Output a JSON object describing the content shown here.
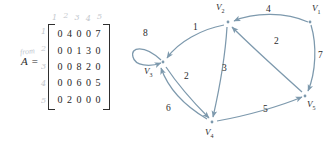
{
  "matrix": {
    "name": "A",
    "equals_sign": "=",
    "column_indices": [
      "1",
      "2",
      "3",
      "4",
      "5"
    ],
    "row_indices": [
      "1",
      "2",
      "3",
      "4",
      "5"
    ],
    "annotation": "from",
    "rows": [
      [
        "0",
        "4",
        "0",
        "0",
        "7"
      ],
      [
        "0",
        "0",
        "1",
        "3",
        "0"
      ],
      [
        "0",
        "0",
        "8",
        "2",
        "0"
      ],
      [
        "0",
        "0",
        "6",
        "0",
        "5"
      ],
      [
        "0",
        "2",
        "0",
        "0",
        "0"
      ]
    ]
  },
  "graph": {
    "ink_color": "#7d99ad",
    "text_color": "#2b2b2b",
    "vertices": [
      {
        "id": "v1",
        "label": "V",
        "sub": "1",
        "x": 184,
        "y": 22,
        "label_x": 186,
        "label_y": 4
      },
      {
        "id": "v2",
        "label": "V",
        "sub": "2",
        "x": 102,
        "y": 22,
        "label_x": 90,
        "label_y": 3
      },
      {
        "id": "v3",
        "label": "V",
        "sub": "3",
        "x": 37,
        "y": 62,
        "label_x": 20,
        "label_y": 66
      },
      {
        "id": "v4",
        "label": "V",
        "sub": "4",
        "x": 86,
        "y": 122,
        "label_x": 80,
        "label_y": 128
      },
      {
        "id": "v5",
        "label": "V",
        "sub": "5",
        "x": 179,
        "y": 96,
        "label_x": 180,
        "label_y": 100
      }
    ],
    "edges": [
      {
        "id": "e-v1-v2",
        "from": "v1",
        "to": "v2",
        "weight": "4",
        "label_x": 140,
        "label_y": 5
      },
      {
        "id": "e-v1-v5",
        "from": "v1",
        "to": "v5",
        "weight": "7",
        "label_x": 191,
        "label_y": 52
      },
      {
        "id": "e-v2-v3",
        "from": "v2",
        "to": "v3",
        "weight": "1",
        "label_x": 66,
        "label_y": 23
      },
      {
        "id": "e-v2-v4",
        "from": "v2",
        "to": "v4",
        "weight": "3",
        "label_x": 95,
        "label_y": 66
      },
      {
        "id": "e-v3-v3",
        "from": "v3",
        "to": "v3",
        "weight": "8",
        "label_x": 17,
        "label_y": 31
      },
      {
        "id": "e-v3-v4",
        "from": "v3",
        "to": "v4",
        "weight": "2",
        "label_x": 58,
        "label_y": 73
      },
      {
        "id": "e-v4-v3",
        "from": "v4",
        "to": "v3",
        "weight": "6",
        "label_x": 41,
        "label_y": 105
      },
      {
        "id": "e-v4-v5",
        "from": "v4",
        "to": "v5",
        "weight": "5",
        "label_x": 137,
        "label_y": 106
      },
      {
        "id": "e-v5-v2",
        "from": "v5",
        "to": "v2",
        "weight": "2",
        "label_x": 147,
        "label_y": 38
      }
    ]
  }
}
